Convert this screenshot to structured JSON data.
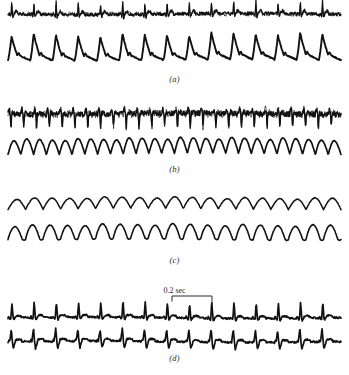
{
  "figure": {
    "title": "",
    "background": "#ffffff",
    "trace_color": "#111111",
    "width": 349,
    "height": 375
  },
  "scale_bar": {
    "label": "0.2 sec",
    "x_start_px": 172,
    "x_end_px": 212,
    "y_px": 296
  },
  "chart_data": {
    "type": "line",
    "title": "",
    "xlabel": "",
    "ylabel": "",
    "grid": false,
    "legend": "none",
    "axis_visible": false,
    "time_scale_bar_seconds": 0.2,
    "time_scale_bar_length_px": 40,
    "panels": [
      {
        "label": "(a)",
        "label_y_px": 79,
        "top_px": 8,
        "height_px": 68,
        "series": [
          {
            "name": "upper-trace-a",
            "kind": "ecg-spiky-noisy",
            "cycles": 15,
            "baseline_y": 22,
            "spike_up_amp": 13,
            "spike_down_amp": 7,
            "noise": 1.6,
            "stroke_width": 1.25
          },
          {
            "name": "lower-trace-a",
            "kind": "pulse-pressure",
            "cycles": 15,
            "baseline_y": 68,
            "peak_amp": 26,
            "noise": 0.5,
            "stroke_width": 1.9
          }
        ]
      },
      {
        "label": "(b)",
        "label_y_px": 172,
        "top_px": 100,
        "height_px": 66,
        "series": [
          {
            "name": "upper-trace-b",
            "kind": "noisy-burst-downspikes",
            "cycles": 26,
            "baseline_y": 118,
            "spike_up_amp": 8,
            "spike_down_amp": 13,
            "noise": 2.6,
            "stroke_width": 1.4
          },
          {
            "name": "lower-trace-b",
            "kind": "sawtooth-oscillation",
            "cycles": 26,
            "baseline_y": 158,
            "peak_amp": 15,
            "noise": 0.3,
            "stroke_width": 1.7
          }
        ]
      },
      {
        "label": "(c)",
        "label_y_px": 261,
        "top_px": 198,
        "height_px": 58,
        "series": [
          {
            "name": "upper-trace-c",
            "kind": "smooth-sine",
            "cycles": 19,
            "baseline_y": 213,
            "peak_amp": 11,
            "noise": 0.25,
            "stroke_width": 1.5
          },
          {
            "name": "lower-trace-c",
            "kind": "smooth-sawtooth",
            "cycles": 19,
            "baseline_y": 243,
            "peak_amp": 14,
            "noise": 0.25,
            "stroke_width": 1.6
          }
        ]
      },
      {
        "label": "(d)",
        "label_y_px": 358,
        "top_px": 300,
        "height_px": 52,
        "series": [
          {
            "name": "upper-trace-d",
            "kind": "qrs-complex",
            "cycles": 15,
            "baseline_y": 320,
            "spike_up_amp": 16,
            "spike_down_amp": 6,
            "noise": 0.8,
            "stroke_width": 1.7
          },
          {
            "name": "lower-trace-d",
            "kind": "qrs-complex-inverted",
            "cycles": 15,
            "baseline_y": 344,
            "spike_up_amp": 14,
            "spike_down_amp": 9,
            "noise": 0.8,
            "stroke_width": 1.7
          }
        ]
      }
    ],
    "x_range_px": [
      8,
      341
    ]
  }
}
